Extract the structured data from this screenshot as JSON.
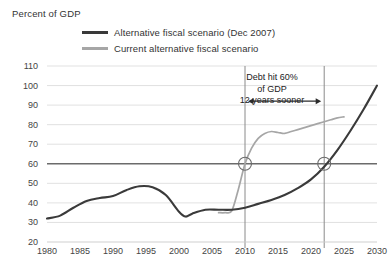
{
  "axis_title": "Percent of GDP",
  "legend": {
    "items": [
      {
        "label": "Alternative fiscal scenario (Dec 2007)",
        "color": "#3a3a3a",
        "style": "dark"
      },
      {
        "label": "Current alternative fiscal scenario",
        "color": "#a6a6a6",
        "style": "light"
      }
    ]
  },
  "callout": {
    "line1": "Debt hit 60%",
    "line2": "of GDP",
    "line3": "12 years sooner"
  },
  "colors": {
    "dark_line": "#3a3a3a",
    "light_line": "#a6a6a6",
    "grid": "#d9d9d9",
    "emphasis_line": "#6b6b6b",
    "annotation": "#555555",
    "text": "#333333"
  },
  "chart_data": {
    "type": "line",
    "title": "",
    "subtitle": "",
    "xlabel": "",
    "ylabel": "Percent of GDP",
    "xlim": [
      1980,
      2030
    ],
    "ylim": [
      20,
      110
    ],
    "ytick_step": 10,
    "xtick_step": 5,
    "grid": true,
    "legend_position": "top",
    "yticks": [
      20,
      30,
      40,
      50,
      60,
      70,
      80,
      90,
      100,
      110
    ],
    "xticks": [
      1980,
      1985,
      1990,
      1995,
      2000,
      2005,
      2010,
      2015,
      2020,
      2025,
      2030
    ],
    "emphasis_gridline": 60,
    "series": [
      {
        "name": "Alternative fiscal scenario (Dec 2007)",
        "color": "#3a3a3a",
        "x": [
          1980,
          1982,
          1984,
          1986,
          1988,
          1990,
          1992,
          1994,
          1996,
          1998,
          2000,
          2001,
          2002,
          2004,
          2006,
          2008,
          2010,
          2012,
          2014,
          2016,
          2018,
          2020,
          2022,
          2024,
          2026,
          2028,
          2030
        ],
        "values": [
          32.0,
          33.5,
          37.5,
          41.0,
          42.5,
          43.5,
          46.5,
          48.5,
          48.0,
          44.0,
          35.5,
          33.0,
          34.5,
          36.5,
          36.5,
          36.5,
          37.5,
          39.5,
          41.5,
          44.0,
          47.5,
          52.0,
          58.5,
          67.0,
          77.0,
          88.0,
          100.0
        ]
      },
      {
        "name": "Current alternative fiscal scenario",
        "color": "#a6a6a6",
        "x": [
          2006,
          2007,
          2008,
          2009,
          2010,
          2011,
          2012,
          2013,
          2014,
          2015,
          2016,
          2017,
          2018,
          2019,
          2020,
          2021,
          2022,
          2023,
          2024,
          2025
        ],
        "values": [
          35.0,
          35.0,
          36.0,
          47.0,
          60.0,
          68.0,
          73.0,
          75.5,
          76.5,
          76.0,
          75.5,
          76.5,
          77.5,
          78.5,
          79.5,
          80.5,
          81.5,
          82.5,
          83.5,
          84.0
        ]
      }
    ],
    "annotations": [
      {
        "type": "vline",
        "x": 2010,
        "label": ""
      },
      {
        "type": "vline",
        "x": 2022,
        "label": ""
      },
      {
        "type": "marker",
        "x": 2010,
        "y": 60,
        "shape": "circle"
      },
      {
        "type": "marker",
        "x": 2022,
        "y": 60,
        "shape": "circle"
      },
      {
        "type": "double-arrow",
        "x_start": 2010,
        "x_end": 2022,
        "y": 92,
        "text": "Debt hit 60% of GDP 12 years sooner"
      }
    ]
  }
}
